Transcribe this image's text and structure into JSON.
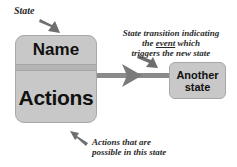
{
  "diagram": {
    "labels": {
      "state": "State",
      "transition_line1": "State transition indicating",
      "transition_line2_prefix": "the ",
      "transition_line2_event": "event",
      "transition_line2_suffix": " which",
      "transition_line3": "triggers the new state",
      "actions_line1": "Actions that are",
      "actions_line2": "possible in this state"
    },
    "state_box": {
      "name": "Name",
      "actions": "Actions"
    },
    "target_state": {
      "line1": "Another",
      "line2": "state"
    },
    "colors": {
      "box_fill": "#c8c8c8",
      "arrow": "#7a7a7a",
      "text": "#111111"
    }
  }
}
